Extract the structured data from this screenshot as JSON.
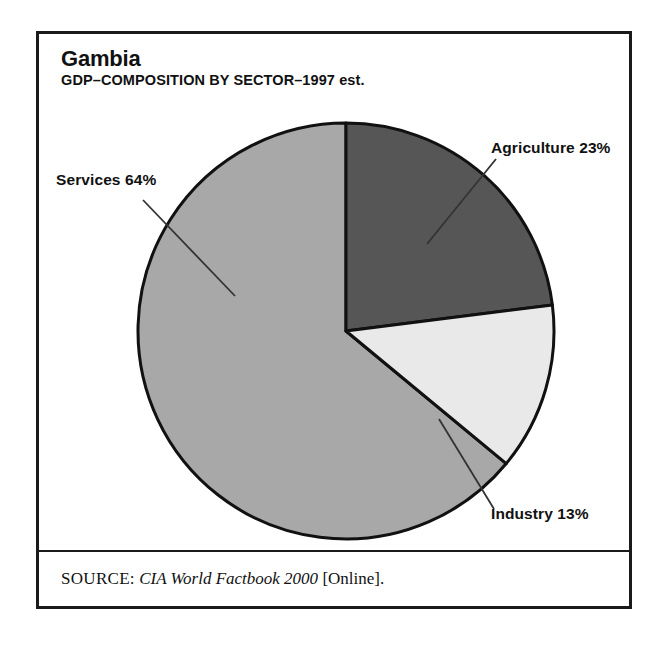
{
  "figure": {
    "title": "Gambia",
    "subtitle": "GDP–COMPOSITION BY SECTOR–1997 est.",
    "source_label": "SOURCE:",
    "source_title": "CIA World Factbook 2000",
    "source_suffix": "[Online].",
    "border_color": "#1a1a1a",
    "background": "#ffffff"
  },
  "labels": {
    "services": "Services 64%",
    "agriculture": "Agriculture 23%",
    "industry": "Industry 13%"
  },
  "chart_data": {
    "type": "pie",
    "title": "Gambia",
    "subtitle": "GDP–COMPOSITION BY SECTOR–1997 est.",
    "xlabel": "",
    "ylabel": "",
    "units": "percent",
    "start_angle_deg": 0,
    "direction": "clockwise",
    "legend": "none (direct labels with leader lines)",
    "grid": false,
    "categories": [
      "Agriculture",
      "Industry",
      "Services"
    ],
    "values": [
      23,
      13,
      64
    ],
    "slices": [
      {
        "name": "Agriculture",
        "value": 23,
        "label": "Agriculture 23%",
        "color": "#565656",
        "start_angle_deg": 0,
        "end_angle_deg": 82.8
      },
      {
        "name": "Industry",
        "value": 13,
        "label": "Industry 13%",
        "color": "#e9e9e9",
        "start_angle_deg": 82.8,
        "end_angle_deg": 129.6
      },
      {
        "name": "Services",
        "value": 64,
        "label": "Services 64%",
        "color": "#a8a8a8",
        "start_angle_deg": 129.6,
        "end_angle_deg": 360
      }
    ],
    "total": 100
  }
}
